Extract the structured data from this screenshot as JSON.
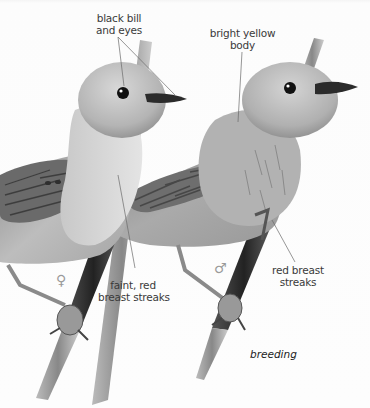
{
  "figure": {
    "caption": "breeding",
    "colors": {
      "background": "#fbfbfb",
      "label_text": "#3a3a3a",
      "leader_line": "#6a6a6a",
      "symbol": "#9a9a9a"
    }
  },
  "labels": {
    "bill_eyes": {
      "line1": "black bill",
      "line2": "and eyes"
    },
    "body": {
      "line1": "bright yellow",
      "line2": "body"
    },
    "female_breast": {
      "line1": "faint, red",
      "line2": "breast streaks"
    },
    "male_breast": {
      "line1": "red breast",
      "line2": "streaks"
    }
  },
  "symbols": {
    "female": "♀",
    "male": "♂"
  }
}
